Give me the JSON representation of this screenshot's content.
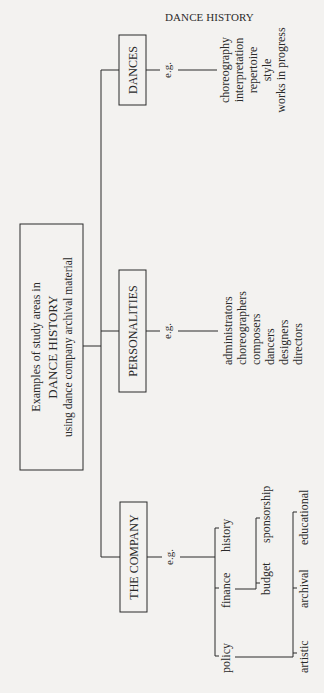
{
  "header": {
    "running_head": "DANCE HISTORY"
  },
  "root": {
    "line1": "Examples of study areas in",
    "line2": "DANCE HISTORY",
    "line3": "using dance company archival material"
  },
  "branches": {
    "dances": {
      "label": "DANCES",
      "eg": "e.g.",
      "items": [
        "choreography",
        "interpretation",
        "repertoire",
        "style",
        "works in progress"
      ]
    },
    "personalities": {
      "label": "PERSONALITIES",
      "eg": "e.g.",
      "items": [
        "administrators",
        "choreographers",
        "composers",
        "dancers",
        "designers",
        "directors"
      ]
    },
    "company": {
      "label": "THE COMPANY",
      "eg": "e.g.",
      "items": [
        "history",
        "finance",
        "policy"
      ],
      "finance_sub": [
        "sponsorship",
        "budget"
      ],
      "policy_sub": [
        "educational",
        "archival",
        "artistic"
      ]
    }
  },
  "colors": {
    "ink": "#2a2a2a",
    "paper": "#f3f2f0"
  }
}
